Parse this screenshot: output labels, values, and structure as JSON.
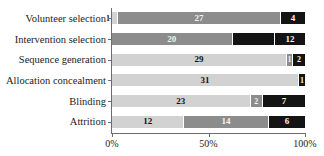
{
  "chart_data": {
    "type": "bar",
    "orientation": "horizontal",
    "stacked": true,
    "stack_mode": "percent",
    "title": "",
    "xlabel": "",
    "ylabel": "",
    "xlim": [
      0,
      100
    ],
    "grid": false,
    "legend": "none",
    "xticks": [
      "0%",
      "50%",
      "100%"
    ],
    "xtick_values": [
      0,
      50,
      100
    ],
    "categories": [
      "Volunteer selection",
      "Intervention selection",
      "Sequence generation",
      "Allocation concealment",
      "Blinding",
      "Attrition"
    ],
    "series": [
      {
        "name": "light",
        "color": "#d2d2d2",
        "values": [
          1,
          0,
          29,
          31,
          23,
          12
        ]
      },
      {
        "name": "medium",
        "color": "#8c8c8c",
        "values": [
          27,
          20,
          1,
          0,
          2,
          14
        ]
      },
      {
        "name": "dark",
        "color": "#141414",
        "values": [
          4,
          12,
          2,
          1,
          7,
          6
        ]
      }
    ],
    "totals": [
      32,
      32,
      32,
      32,
      32,
      32
    ],
    "rows": [
      {
        "category": "Volunteer selection",
        "segments": [
          {
            "tone": "light",
            "value": 1,
            "label": "1",
            "label_placement": "outside-left"
          },
          {
            "tone": "medium",
            "value": 27,
            "label": "27",
            "label_placement": "inside"
          },
          {
            "tone": "dark",
            "value": 4,
            "label": "4",
            "label_placement": "inside"
          }
        ]
      },
      {
        "category": "Intervention selection",
        "segments": [
          {
            "tone": "medium",
            "value": 20,
            "label": "20",
            "label_placement": "inside"
          },
          {
            "tone": "dark",
            "value": 7,
            "label": "",
            "label_placement": "inside"
          },
          {
            "tone": "dark",
            "value": 5,
            "label": "12",
            "label_placement": "inside"
          }
        ]
      },
      {
        "category": "Sequence generation",
        "segments": [
          {
            "tone": "light",
            "value": 29,
            "label": "29",
            "label_placement": "inside"
          },
          {
            "tone": "medium",
            "value": 1,
            "label": "1",
            "label_placement": "inside"
          },
          {
            "tone": "dark",
            "value": 2,
            "label": "2",
            "label_placement": "inside"
          }
        ]
      },
      {
        "category": "Allocation concealment",
        "segments": [
          {
            "tone": "light",
            "value": 31,
            "label": "31",
            "label_placement": "inside"
          },
          {
            "tone": "dark",
            "value": 1,
            "label": "1",
            "label_placement": "inside"
          }
        ]
      },
      {
        "category": "Blinding",
        "segments": [
          {
            "tone": "light",
            "value": 23,
            "label": "23",
            "label_placement": "inside"
          },
          {
            "tone": "medium",
            "value": 2,
            "label": "2",
            "label_placement": "inside"
          },
          {
            "tone": "dark",
            "value": 7,
            "label": "7",
            "label_placement": "inside"
          }
        ]
      },
      {
        "category": "Attrition",
        "segments": [
          {
            "tone": "light",
            "value": 12,
            "label": "12",
            "label_placement": "inside"
          },
          {
            "tone": "medium",
            "value": 14,
            "label": "14",
            "label_placement": "inside"
          },
          {
            "tone": "dark",
            "value": 6,
            "label": "6",
            "label_placement": "inside"
          }
        ]
      }
    ]
  }
}
